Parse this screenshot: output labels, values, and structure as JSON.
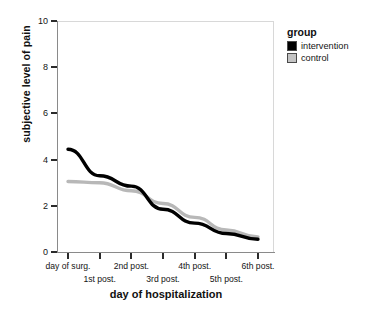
{
  "chart_data": {
    "type": "line",
    "title": "",
    "xlabel": "day of hospitalization",
    "ylabel": "subjective level of pain",
    "categories": [
      "day of surg.",
      "1st post.",
      "2nd post.",
      "3rd post.",
      "4th post.",
      "5th post.",
      "6th post."
    ],
    "ylim": [
      0,
      10
    ],
    "yticks": [
      0,
      2,
      4,
      6,
      8,
      10
    ],
    "ytick_labels": [
      "0",
      "2",
      "4",
      "6",
      "8",
      "10"
    ],
    "grid": false,
    "legend_position": "right",
    "legend_title": "group",
    "series": [
      {
        "name": "intervention",
        "color": "#000000",
        "values": [
          4.45,
          3.3,
          2.85,
          1.85,
          1.25,
          0.8,
          0.55
        ]
      },
      {
        "name": "control",
        "color": "#b8b8b8",
        "values": [
          3.05,
          3.0,
          2.65,
          2.1,
          1.5,
          0.95,
          0.65
        ]
      }
    ]
  },
  "legend": {
    "title": "group",
    "items": [
      {
        "label": "intervention",
        "color": "#000000"
      },
      {
        "label": "control",
        "color": "#c4c4c4"
      }
    ]
  },
  "axes": {
    "y_title": "subjective level of pain",
    "x_title": "day of hospitalization",
    "y_ticks": [
      "0",
      "2",
      "4",
      "6",
      "8",
      "10"
    ],
    "x_ticks": [
      "day of surg.",
      "1st post.",
      "2nd post.",
      "3rd post.",
      "4th post.",
      "5th post.",
      "6th post."
    ]
  }
}
